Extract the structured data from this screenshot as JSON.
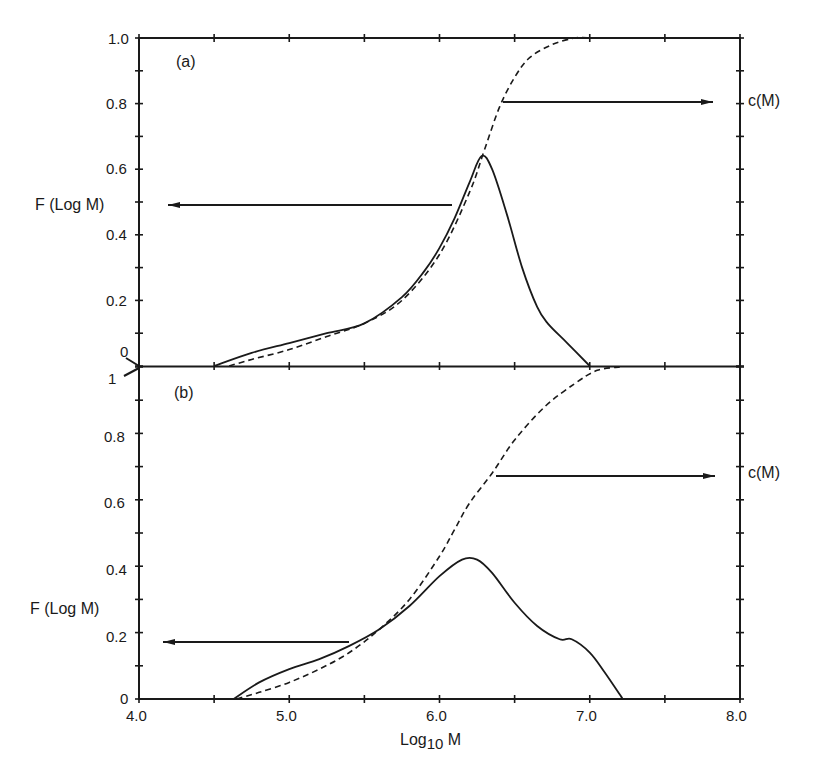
{
  "chart_data": [
    {
      "panel": "(a)",
      "type": "line",
      "xlabel": "Log10 M",
      "ylabel_left": "F (Log M)",
      "ylabel_right": "c(M)",
      "xlim": [
        4.0,
        8.0
      ],
      "ylim": [
        0,
        1.0
      ],
      "yticks": [
        "0",
        "0.2",
        "0.4",
        "0.6",
        "0.8",
        "1.0"
      ],
      "series": [
        {
          "name": "F (Log M)",
          "style": "solid",
          "x": [
            4.5,
            4.75,
            5.0,
            5.25,
            5.5,
            5.75,
            5.9,
            6.0,
            6.1,
            6.2,
            6.28,
            6.35,
            6.45,
            6.55,
            6.65,
            6.72,
            6.85,
            7.0
          ],
          "y": [
            0.0,
            0.04,
            0.07,
            0.1,
            0.13,
            0.21,
            0.29,
            0.36,
            0.45,
            0.56,
            0.64,
            0.6,
            0.46,
            0.3,
            0.18,
            0.13,
            0.07,
            0.0
          ]
        },
        {
          "name": "c(M)",
          "style": "dashed",
          "x": [
            4.6,
            4.75,
            5.0,
            5.25,
            5.5,
            5.75,
            6.0,
            6.2,
            6.3,
            6.4,
            6.5,
            6.6,
            6.75,
            6.9,
            7.0
          ],
          "y": [
            0.0,
            0.02,
            0.05,
            0.09,
            0.13,
            0.2,
            0.34,
            0.53,
            0.66,
            0.79,
            0.88,
            0.94,
            0.98,
            1.0,
            1.0
          ]
        }
      ],
      "annotations": [
        {
          "text": "arrow pointing left to F (Log M) axis",
          "y": 0.48
        },
        {
          "text": "arrow pointing right to c(M) axis",
          "y": 0.8
        }
      ]
    },
    {
      "panel": "(b)",
      "type": "line",
      "xlabel": "Log10 M",
      "ylabel_left": "F (Log M)",
      "ylabel_right": "c(M)",
      "xlim": [
        4.0,
        8.0
      ],
      "ylim": [
        0,
        1.0
      ],
      "yticks": [
        "0",
        "0.2",
        "0.4",
        "0.6",
        "0.8",
        "1"
      ],
      "xticks": [
        "4.0",
        "5.0",
        "6.0",
        "7.0",
        "8.0"
      ],
      "series": [
        {
          "name": "F (Log M)",
          "style": "solid",
          "x": [
            4.63,
            4.8,
            5.0,
            5.2,
            5.4,
            5.6,
            5.8,
            6.0,
            6.15,
            6.25,
            6.35,
            6.5,
            6.65,
            6.8,
            6.88,
            7.0,
            7.1,
            7.22
          ],
          "y": [
            0.0,
            0.05,
            0.09,
            0.12,
            0.16,
            0.21,
            0.28,
            0.37,
            0.42,
            0.42,
            0.38,
            0.29,
            0.22,
            0.18,
            0.18,
            0.14,
            0.08,
            0.0
          ]
        },
        {
          "name": "c(M)",
          "style": "dashed",
          "x": [
            4.65,
            4.8,
            5.0,
            5.2,
            5.4,
            5.6,
            5.8,
            6.0,
            6.1,
            6.2,
            6.35,
            6.5,
            6.7,
            6.9,
            7.05,
            7.2
          ],
          "y": [
            0.0,
            0.02,
            0.05,
            0.09,
            0.14,
            0.21,
            0.3,
            0.43,
            0.51,
            0.59,
            0.68,
            0.78,
            0.88,
            0.95,
            0.99,
            1.0
          ]
        }
      ],
      "annotations": [
        {
          "text": "arrow pointing left to F (Log M) axis",
          "y": 0.17
        },
        {
          "text": "arrow pointing right to c(M) axis",
          "y": 0.66
        }
      ]
    }
  ],
  "labels": {
    "panel_a": "(a)",
    "panel_b": "(b)",
    "f_label": "F (Log M)",
    "c_label": "c(M)",
    "x_axis_label_main": "Log",
    "x_axis_label_sub": "10",
    "x_axis_label_end": " M",
    "top_yticks": [
      "1.0",
      "0.8",
      "0.6",
      "0.4",
      "0.2",
      "0"
    ],
    "bottom_yticks": [
      "1",
      "0.8",
      "0.6",
      "0.4",
      "0.2",
      "0"
    ],
    "xticks": [
      "4.0",
      "5.0",
      "6.0",
      "7.0",
      "8.0"
    ]
  }
}
